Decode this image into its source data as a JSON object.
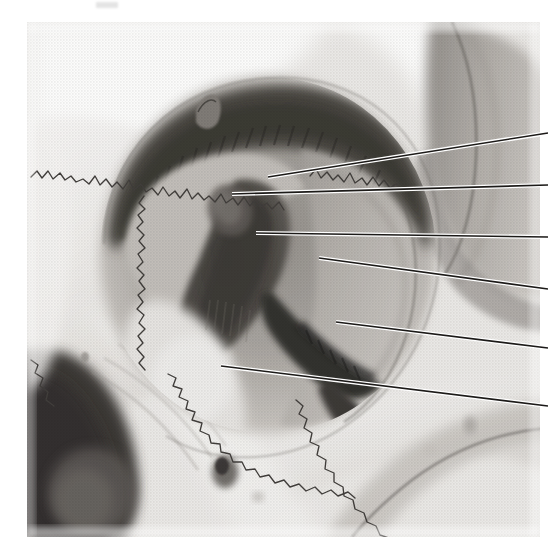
{
  "figure": {
    "title": "Acetabulum of the hip bone (right lateral view)",
    "caption": "",
    "medium": "halftone grayscale anatomical photograph / illustration",
    "background_color": "#ffffff",
    "photo_frame": {
      "x": 27,
      "y": 22,
      "width": 513,
      "height": 515,
      "fill_base": "#d8d6d3"
    },
    "top_artifact": {
      "present": true,
      "description": "faint cropped mark at top edge",
      "x": 96,
      "y": 2,
      "width": 22,
      "height": 7,
      "color": "#b9b9b9"
    }
  },
  "palette": {
    "paper_white": "#ffffff",
    "bone_highlight": "#f2f1ef",
    "bone_light": "#e3e1de",
    "bone_mid": "#c9c6c2",
    "bone_shadow": "#a7a39e",
    "cartilage_grey": "#9d9a96",
    "deep_grey": "#7b7772",
    "fossa_dark": "#4a4641",
    "notch_black": "#2e2b28",
    "suture_line": "#3a3734",
    "leader_line": "#1c1a18",
    "leader_halo": "#ffffff"
  },
  "leader_lines": {
    "count": 6,
    "stroke_color": "#1c1a18",
    "halo_color": "#ffffff",
    "stroke_width": 1.6,
    "halo_width": 4.2,
    "labels_visible": false,
    "note": "Leader lines run off the right edge of the frame; label text is cropped out of the image.",
    "items": [
      {
        "id": 1,
        "tip_x": 268,
        "tip_y": 177,
        "end_x": 548,
        "end_y": 133,
        "target": "acetabular-rim-superior"
      },
      {
        "id": 2,
        "tip_x": 232,
        "tip_y": 194,
        "end_x": 548,
        "end_y": 185,
        "target": "acetabular-fossa-upper"
      },
      {
        "id": 3,
        "tip_x": 256,
        "tip_y": 233,
        "end_x": 548,
        "end_y": 237,
        "target": "acetabular-fossa"
      },
      {
        "id": 4,
        "tip_x": 319,
        "tip_y": 258,
        "end_x": 548,
        "end_y": 289,
        "target": "lunate-surface"
      },
      {
        "id": 5,
        "tip_x": 336,
        "tip_y": 322,
        "end_x": 548,
        "end_y": 348,
        "target": "acetabular-notch"
      },
      {
        "id": 6,
        "tip_x": 221,
        "tip_y": 366,
        "end_x": 548,
        "end_y": 406,
        "target": "ischiopubic-region"
      }
    ]
  },
  "anatomy_regions": [
    {
      "name": "ilium-body",
      "tone": "#e8e6e3"
    },
    {
      "name": "acetabular-rim",
      "tone": "#8b8782"
    },
    {
      "name": "acetabular-fossa",
      "tone": "#46423d"
    },
    {
      "name": "lunate-surface",
      "tone": "#b0aca7"
    },
    {
      "name": "acetabular-notch",
      "tone": "#32302c"
    },
    {
      "name": "greater-sciatic-notch",
      "tone": "#3d3a36"
    },
    {
      "name": "femur-greater-trochanter",
      "tone": "#a29e99"
    },
    {
      "name": "pubic-ramus",
      "tone": "#efeeec"
    },
    {
      "name": "ischial-tuberosity",
      "tone": "#dedcd9"
    }
  ],
  "suture_lines": {
    "description": "irregular zig-zag triradiate (Y-shaped) epiphyseal suture lines across the acetabulum",
    "color": "#3a3734",
    "width": 1.3,
    "count": 5
  }
}
